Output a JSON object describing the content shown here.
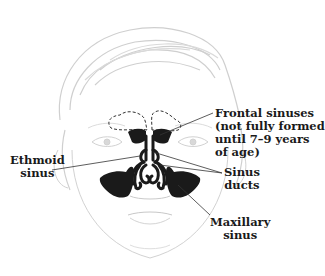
{
  "diagram": {
    "colors": {
      "sinus_fill": "#1a1a1a",
      "sketch": "#c8c8c8",
      "leader_line": "#333333",
      "label_text": "#1a1a1a",
      "background": "#ffffff"
    },
    "labels": {
      "frontal": {
        "line1": "Frontal sinuses",
        "line2": "(not fully formed",
        "line3": "until 7–9 years",
        "line4": "of age)"
      },
      "ethmoid": {
        "line1": "Ethmoid",
        "line2": "sinus"
      },
      "ducts": {
        "line1": "Sinus",
        "line2": "ducts"
      },
      "maxillary": {
        "line1": "Maxillary",
        "line2": "sinus"
      }
    }
  }
}
